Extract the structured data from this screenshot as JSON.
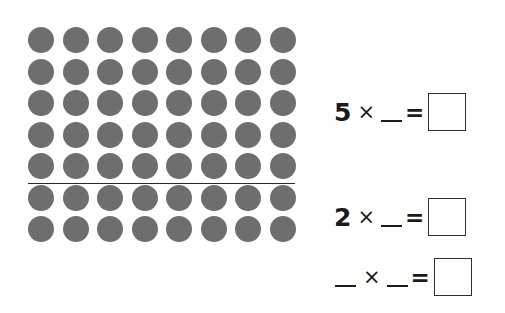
{
  "worksheet": {
    "background_color": "#ffffff",
    "dot_color": "#6e6e6e",
    "line_color": "#2a2a2a",
    "text_color": "#1b1b1b",
    "box_border_color": "#2f2f2f"
  },
  "array": {
    "columns": 8,
    "rows": 7,
    "total_dots": 56,
    "partition_after_row": 5,
    "rows_above_line": 5,
    "rows_below_line": 2,
    "dot_diameter_px": 26,
    "column_spacing_px": 34.5,
    "row_spacing_px": 31.5,
    "origin_x_px": 28,
    "origin_y_px": 27
  },
  "partition": {
    "label": "partition-line",
    "y_px": 183,
    "x_start_px": 28,
    "x_end_px": 295
  },
  "equations": [
    {
      "id": "equation-1",
      "top_px": 90,
      "first_factor": "5",
      "first_factor_is_blank": false,
      "operator": "×",
      "second_factor": "",
      "second_factor_is_blank": true,
      "equals": "=",
      "answer": "",
      "answer_box_empty": true
    },
    {
      "id": "equation-2",
      "top_px": 195,
      "first_factor": "2",
      "first_factor_is_blank": false,
      "operator": "×",
      "second_factor": "",
      "second_factor_is_blank": true,
      "equals": "=",
      "answer": "",
      "answer_box_empty": true
    },
    {
      "id": "equation-3",
      "top_px": 255,
      "first_factor": "",
      "first_factor_is_blank": true,
      "operator": "×",
      "second_factor": "",
      "second_factor_is_blank": true,
      "equals": "=",
      "answer": "",
      "answer_box_empty": true
    }
  ]
}
